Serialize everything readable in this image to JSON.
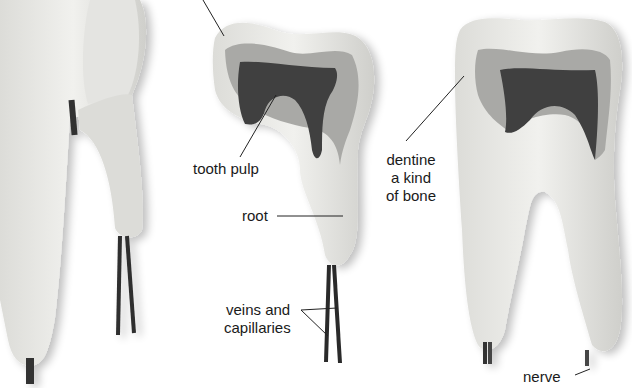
{
  "diagram": {
    "teeth": [
      {
        "name": "whole-tooth-model",
        "view": "exterior"
      },
      {
        "name": "incisor-cross-section",
        "view": "section"
      },
      {
        "name": "molar-cross-section",
        "view": "section"
      }
    ],
    "labels": {
      "tooth_pulp": "tooth pulp",
      "root": "root",
      "veins_line1": "veins and",
      "veins_line2": "capillaries",
      "dentine_line1": "dentine",
      "dentine_line2": "a kind",
      "dentine_line3": "of bone",
      "nerve": "nerve"
    },
    "colors": {
      "background": "#ffffff",
      "tooth_surface": "#e9e9e6",
      "tooth_shadow": "#c9c9c5",
      "dentine": "#a9a9a6",
      "pulp": "#3f3f3f",
      "vessel": "#2a2a2a",
      "leader_line": "#222222"
    }
  }
}
